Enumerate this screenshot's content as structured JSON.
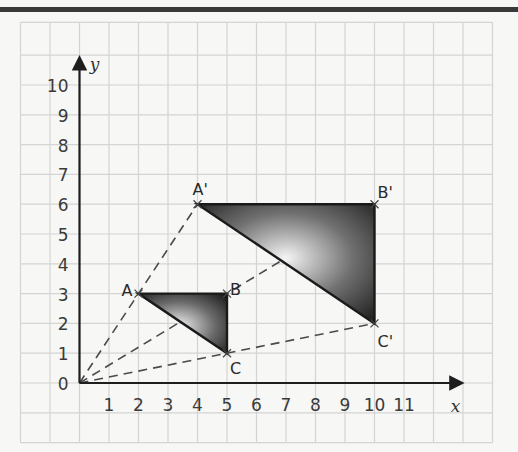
{
  "diagram": {
    "type": "coordinate-grid-enlargement",
    "axes": {
      "x_label": "x",
      "y_label": "y",
      "x_ticks": [
        "1",
        "2",
        "3",
        "4",
        "5",
        "6",
        "7",
        "8",
        "9",
        "10",
        "11"
      ],
      "y_ticks": [
        "0",
        "1",
        "2",
        "3",
        "4",
        "5",
        "6",
        "7",
        "8",
        "9",
        "10"
      ],
      "origin_label": "0"
    },
    "centre_of_enlargement": [
      0,
      0
    ],
    "scale_factor": 2,
    "points": {
      "A": {
        "label": "A",
        "x": 2,
        "y": 3
      },
      "B": {
        "label": "B",
        "x": 5,
        "y": 3
      },
      "C": {
        "label": "C",
        "x": 5,
        "y": 1
      },
      "A_prime": {
        "label": "A'",
        "x": 4,
        "y": 6
      },
      "B_prime": {
        "label": "B'",
        "x": 10,
        "y": 6
      },
      "C_prime": {
        "label": "C'",
        "x": 10,
        "y": 2
      }
    },
    "triangles": [
      {
        "name": "ABC",
        "vertices": [
          "A",
          "B",
          "C"
        ]
      },
      {
        "name": "A'B'C'",
        "vertices": [
          "A'",
          "B'",
          "C'"
        ]
      }
    ],
    "colors": {
      "grid": "#d4d4d4",
      "axis": "#1e1e1e",
      "triangle_dark": "#1a1a1a",
      "triangle_light": "#f4f4f4",
      "dashed": "#4a4a4a",
      "background": "#f7f7f5"
    }
  }
}
